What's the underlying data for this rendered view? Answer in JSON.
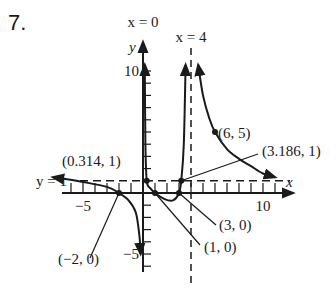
{
  "problem_number": "7.",
  "chart_data": {
    "type": "line",
    "title": "",
    "xlabel": "x",
    "ylabel": "y",
    "xlim": [
      -7,
      12
    ],
    "ylim": [
      -6,
      11
    ],
    "x_ticks": [
      {
        "value": -5,
        "label": "−5"
      },
      {
        "value": 10,
        "label": "10"
      }
    ],
    "y_ticks": [
      {
        "value": 10,
        "label": "10"
      },
      {
        "value": -5,
        "label": "−5"
      }
    ],
    "asymptotes": [
      {
        "type": "vertical",
        "value": 0,
        "label": "x = 0"
      },
      {
        "type": "vertical",
        "value": 4,
        "label": "x = 4"
      },
      {
        "type": "horizontal",
        "value": 1,
        "label": "y = 1"
      }
    ],
    "points": [
      {
        "x": -2,
        "y": 0,
        "label": "(−2, 0)"
      },
      {
        "x": 1,
        "y": 0,
        "label": "(1, 0)"
      },
      {
        "x": 3,
        "y": 0,
        "label": "(3, 0)"
      },
      {
        "x": 0.314,
        "y": 1,
        "label": "(0.314, 1)"
      },
      {
        "x": 3.186,
        "y": 1,
        "label": "(3.186, 1)"
      },
      {
        "x": 6,
        "y": 5,
        "label": "(6, 5)"
      }
    ],
    "series": [
      {
        "name": "left-branch",
        "points": [
          [
            -7.5,
            1.3
          ],
          [
            -5,
            0.9
          ],
          [
            -3,
            0.5
          ],
          [
            -2,
            0
          ],
          [
            -1.2,
            -0.6
          ],
          [
            -0.6,
            -1.6
          ],
          [
            -0.3,
            -3.5
          ],
          [
            -0.2,
            -5
          ]
        ]
      },
      {
        "name": "middle-branch",
        "points": [
          [
            0.15,
            10.5
          ],
          [
            0.2,
            4
          ],
          [
            0.314,
            1
          ],
          [
            0.6,
            0.4
          ],
          [
            1,
            0
          ],
          [
            1.8,
            -0.5
          ],
          [
            2.5,
            -0.6
          ],
          [
            3,
            0
          ],
          [
            3.186,
            1
          ],
          [
            3.4,
            4
          ],
          [
            3.55,
            10.5
          ]
        ]
      },
      {
        "name": "right-branch",
        "points": [
          [
            4.6,
            10.5
          ],
          [
            5,
            8
          ],
          [
            5.5,
            6.2
          ],
          [
            6,
            5
          ],
          [
            7,
            3.6
          ],
          [
            8,
            2.8
          ],
          [
            9,
            2.2
          ],
          [
            10,
            1.6
          ],
          [
            11,
            1.3
          ]
        ]
      }
    ]
  }
}
